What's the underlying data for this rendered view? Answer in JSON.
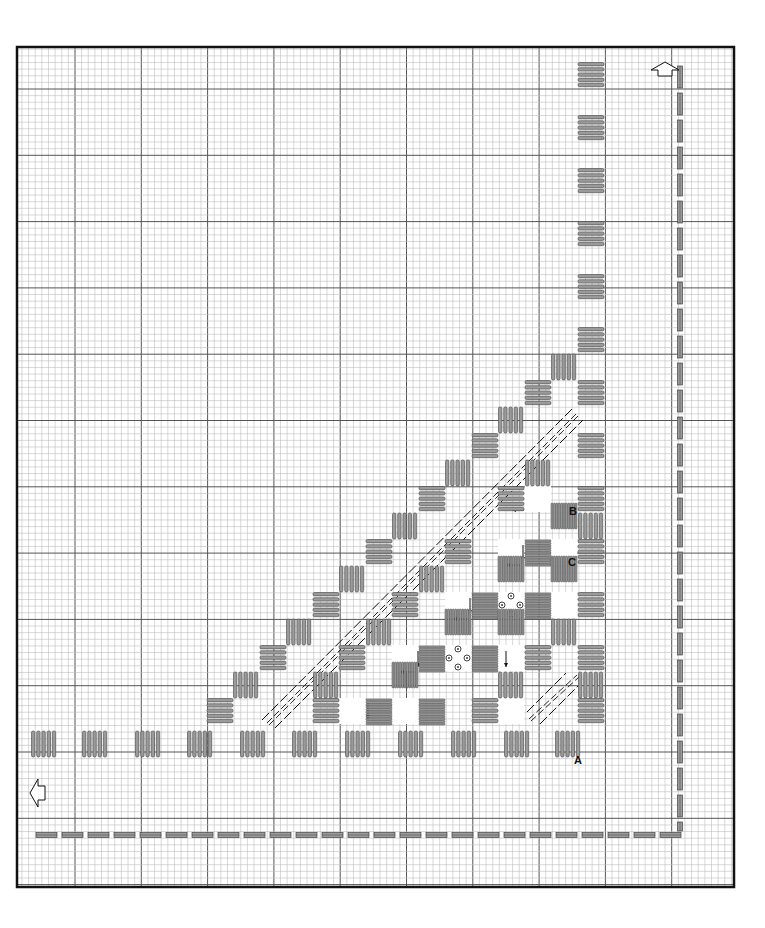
{
  "diagram": {
    "type": "needlework-stitch-chart",
    "frame": {
      "x": 17,
      "y": 47,
      "width": 717,
      "height": 840
    },
    "grid": {
      "cell": 6.63,
      "bold_every": 10,
      "bold_x0": 75,
      "bold_y0": 89,
      "fine_color": "#bdbdbd",
      "bold_color": "#555555",
      "border_color": "#111111"
    },
    "colors": {
      "stitch_fill": "#9a9a9a",
      "stitch_stroke": "#444444",
      "dash_fill": "#9a9a9a",
      "ink": "#111111"
    },
    "labels": [
      {
        "id": "A",
        "text": "A",
        "x": 574,
        "y": 764
      },
      {
        "id": "B",
        "text": "B",
        "x": 569,
        "y": 515
      },
      {
        "id": "C",
        "text": "C",
        "x": 568,
        "y": 566
      }
    ],
    "arrows_outline": [
      {
        "name": "up-arrow-icon",
        "direction": "up",
        "x": 665,
        "y": 68
      },
      {
        "name": "left-arrow-icon",
        "direction": "left",
        "x": 38,
        "y": 793
      }
    ],
    "kloster_blocks": [
      {
        "o": "h",
        "x": 578,
        "y": 62
      },
      {
        "o": "h",
        "x": 578,
        "y": 115
      },
      {
        "o": "h",
        "x": 578,
        "y": 168
      },
      {
        "o": "h",
        "x": 578,
        "y": 221
      },
      {
        "o": "h",
        "x": 578,
        "y": 274
      },
      {
        "o": "h",
        "x": 578,
        "y": 327
      },
      {
        "o": "v",
        "x": 551,
        "y": 354
      },
      {
        "o": "h",
        "x": 578,
        "y": 380
      },
      {
        "o": "h",
        "x": 525,
        "y": 380
      },
      {
        "o": "v",
        "x": 498,
        "y": 407
      },
      {
        "o": "h",
        "x": 578,
        "y": 433
      },
      {
        "o": "h",
        "x": 472,
        "y": 433
      },
      {
        "o": "v",
        "x": 445,
        "y": 460
      },
      {
        "o": "v",
        "x": 525,
        "y": 460
      },
      {
        "o": "h",
        "x": 578,
        "y": 486
      },
      {
        "o": "h",
        "x": 419,
        "y": 486
      },
      {
        "o": "h",
        "x": 498,
        "y": 486
      },
      {
        "o": "v",
        "x": 392,
        "y": 513
      },
      {
        "o": "v",
        "x": 578,
        "y": 513
      },
      {
        "o": "h",
        "x": 366,
        "y": 539
      },
      {
        "o": "h",
        "x": 445,
        "y": 539
      },
      {
        "o": "h",
        "x": 578,
        "y": 539
      },
      {
        "o": "v",
        "x": 339,
        "y": 566
      },
      {
        "o": "v",
        "x": 419,
        "y": 566
      },
      {
        "o": "h",
        "x": 313,
        "y": 592
      },
      {
        "o": "h",
        "x": 392,
        "y": 592
      },
      {
        "o": "h",
        "x": 578,
        "y": 592
      },
      {
        "o": "v",
        "x": 286,
        "y": 619
      },
      {
        "o": "v",
        "x": 366,
        "y": 619
      },
      {
        "o": "v",
        "x": 551,
        "y": 619
      },
      {
        "o": "h",
        "x": 260,
        "y": 645
      },
      {
        "o": "h",
        "x": 339,
        "y": 645
      },
      {
        "o": "h",
        "x": 525,
        "y": 645
      },
      {
        "o": "h",
        "x": 578,
        "y": 645
      },
      {
        "o": "v",
        "x": 233,
        "y": 672
      },
      {
        "o": "v",
        "x": 313,
        "y": 672
      },
      {
        "o": "v",
        "x": 498,
        "y": 672
      },
      {
        "o": "v",
        "x": 578,
        "y": 672
      },
      {
        "o": "h",
        "x": 207,
        "y": 698
      },
      {
        "o": "h",
        "x": 313,
        "y": 698
      },
      {
        "o": "h",
        "x": 472,
        "y": 698
      },
      {
        "o": "h",
        "x": 578,
        "y": 698
      },
      {
        "o": "v",
        "x": 31,
        "y": 731
      },
      {
        "o": "v",
        "x": 82,
        "y": 731
      },
      {
        "o": "v",
        "x": 135,
        "y": 731
      },
      {
        "o": "v",
        "x": 187,
        "y": 731
      },
      {
        "o": "v",
        "x": 240,
        "y": 731
      },
      {
        "o": "v",
        "x": 292,
        "y": 731
      },
      {
        "o": "v",
        "x": 345,
        "y": 731
      },
      {
        "o": "v",
        "x": 398,
        "y": 731
      },
      {
        "o": "v",
        "x": 451,
        "y": 731
      },
      {
        "o": "v",
        "x": 504,
        "y": 731
      },
      {
        "o": "v",
        "x": 555,
        "y": 731
      }
    ],
    "wrapped_blocks": [
      {
        "o": "v",
        "x": 551,
        "y": 503
      },
      {
        "o": "h",
        "x": 525,
        "y": 540
      },
      {
        "o": "v",
        "x": 498,
        "y": 556
      },
      {
        "o": "v",
        "x": 551,
        "y": 556
      },
      {
        "o": "h",
        "x": 472,
        "y": 593
      },
      {
        "o": "h",
        "x": 525,
        "y": 593
      },
      {
        "o": "v",
        "x": 445,
        "y": 609
      },
      {
        "o": "v",
        "x": 498,
        "y": 609
      },
      {
        "o": "h",
        "x": 419,
        "y": 646
      },
      {
        "o": "h",
        "x": 472,
        "y": 646
      },
      {
        "o": "v",
        "x": 392,
        "y": 662
      },
      {
        "o": "h",
        "x": 366,
        "y": 699
      },
      {
        "o": "h",
        "x": 419,
        "y": 699
      }
    ],
    "open_squares": [
      {
        "x": 525,
        "y": 486,
        "arrows": [
          {
            "dir": "left",
            "x1": 524,
            "y1": 510,
            "x2": 512,
            "y2": 510
          }
        ]
      },
      {
        "x": 498,
        "y": 539,
        "arrows": [
          {
            "dir": "down",
            "x1": 523,
            "y1": 545,
            "x2": 523,
            "y2": 561
          },
          {
            "dir": "left",
            "x1": 520,
            "y1": 565,
            "x2": 506,
            "y2": 565
          }
        ]
      },
      {
        "x": 551,
        "y": 539,
        "arrows": []
      },
      {
        "x": 445,
        "y": 592,
        "arrows": [
          {
            "dir": "down",
            "x1": 470,
            "y1": 598,
            "x2": 470,
            "y2": 614
          },
          {
            "dir": "left",
            "x1": 467,
            "y1": 619,
            "x2": 453,
            "y2": 619
          }
        ]
      },
      {
        "x": 498,
        "y": 592,
        "eyelets": true,
        "arrows": []
      },
      {
        "x": 551,
        "y": 592,
        "arrows": []
      },
      {
        "x": 392,
        "y": 645,
        "arrows": [
          {
            "dir": "down",
            "x1": 418,
            "y1": 651,
            "x2": 418,
            "y2": 667
          },
          {
            "dir": "left",
            "x1": 414,
            "y1": 672,
            "x2": 400,
            "y2": 672
          }
        ]
      },
      {
        "x": 445,
        "y": 645,
        "eyelets": true,
        "arrows": []
      },
      {
        "x": 498,
        "y": 645,
        "arrows": [
          {
            "dir": "down",
            "x1": 506,
            "y1": 651,
            "x2": 506,
            "y2": 667
          }
        ]
      },
      {
        "x": 339,
        "y": 698,
        "arrows": [
          {
            "dir": "down",
            "x1": 368,
            "y1": 703,
            "x2": 368,
            "y2": 719
          }
        ]
      },
      {
        "x": 392,
        "y": 698,
        "arrows": []
      },
      {
        "x": 498,
        "y": 698,
        "arrows": []
      }
    ],
    "diagonal_lines": [
      {
        "kind": "outer",
        "x1": 262,
        "y1": 720,
        "x2": 573,
        "y2": 408
      },
      {
        "kind": "double",
        "x1": 268,
        "y1": 724,
        "x2": 578,
        "y2": 414
      },
      {
        "kind": "outer",
        "x1": 275,
        "y1": 728,
        "x2": 583,
        "y2": 420
      },
      {
        "kind": "outer",
        "x1": 527,
        "y1": 712,
        "x2": 566,
        "y2": 673
      },
      {
        "kind": "double",
        "x1": 530,
        "y1": 720,
        "x2": 578,
        "y2": 676
      },
      {
        "kind": "outer",
        "x1": 540,
        "y1": 724,
        "x2": 578,
        "y2": 686
      }
    ],
    "dashed_border": {
      "vertical": {
        "x": 680,
        "y_start": 66,
        "y_end": 831,
        "dash": 22,
        "gap": 5
      },
      "horizontal": {
        "y": 835,
        "x_start": 36,
        "x_end": 682,
        "dash": 21,
        "gap": 5
      }
    }
  }
}
